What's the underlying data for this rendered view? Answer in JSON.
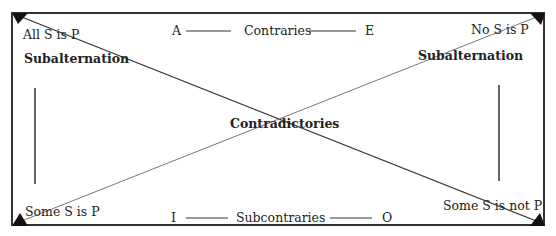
{
  "diagram": {
    "corners": {
      "top_left": {
        "letter": "A",
        "proposition": "All S is P"
      },
      "top_right": {
        "letter": "E",
        "proposition": "No S is P"
      },
      "bottom_left": {
        "letter": "I",
        "proposition": "Some S is P"
      },
      "bottom_right": {
        "letter": "O",
        "proposition": "Some S is not P"
      }
    },
    "relations": {
      "top": "Contraries",
      "bottom": "Subcontraries",
      "left": "Subalternation",
      "right": "Subalternation",
      "diagonal": "Contradictories"
    },
    "colors": {
      "line": "#333333",
      "diagonal_light": "#9a9a9a",
      "text": "#222222"
    }
  }
}
